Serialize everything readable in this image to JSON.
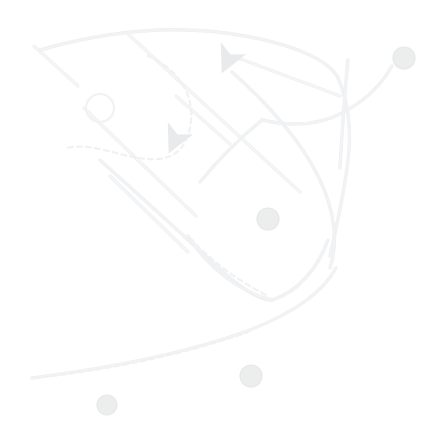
{
  "map": {
    "title": "Street Map View",
    "width": 448,
    "height": 437,
    "background_color": "#ffffff",
    "render_style": "very-low-contrast-faded",
    "zoom_level": "",
    "attribution": "",
    "colors": {
      "background": "#ffffff",
      "road_major": "#f2f3f4",
      "road_minor": "#f5f6f7",
      "road_casing": "#eeeff1",
      "rail_dashed": "#f0f1f2",
      "marker_fill": "#eceded",
      "marker_stroke": "#e7e8e9",
      "arrow_fill": "#e9eaeb",
      "circle_stroke": "#f1f2f3"
    },
    "layers": [
      {
        "id": "roads-curved",
        "name": "Curved Roads",
        "visible": true
      },
      {
        "id": "roads-diagonal",
        "name": "Diagonal Roads",
        "visible": true
      },
      {
        "id": "rail-dashed",
        "name": "Dashed Path",
        "visible": true
      },
      {
        "id": "markers",
        "name": "Place Markers",
        "visible": true
      },
      {
        "id": "direction-arrows",
        "name": "Direction Arrows",
        "visible": true
      }
    ],
    "roads_curved": [
      {
        "id": "road-north-loop",
        "d": "M 40 50 C 110 30 180 24 245 36 C 300 46 330 62 338 78"
      },
      {
        "id": "road-east-descend",
        "d": "M 338 78 C 348 100 352 130 348 160 C 344 196 336 228 330 256"
      },
      {
        "id": "road-center-diagonal",
        "d": "M 232 72 C 268 104 300 140 318 176 C 336 212 338 244 330 268"
      },
      {
        "id": "road-center-west",
        "d": "M 100 160 C 140 196 180 232 212 262 C 240 288 258 300 272 300"
      },
      {
        "id": "road-lower-arc",
        "d": "M 272 300 C 298 292 318 268 328 240"
      },
      {
        "id": "road-inner-arc",
        "d": "M 188 236 C 208 268 240 292 272 300"
      },
      {
        "id": "road-long-sweep",
        "d": "M 32 378 C 110 368 190 352 250 330 C 300 310 324 290 336 268"
      },
      {
        "id": "road-branch-upper",
        "d": "M 262 120 C 296 128 322 124 344 112"
      },
      {
        "id": "road-branch-right",
        "d": "M 344 112 C 366 100 382 84 392 66"
      },
      {
        "id": "road-vertical-right",
        "d": "M 348 60 C 344 96 342 136 340 168"
      },
      {
        "id": "road-spur-left",
        "d": "M 262 120 C 240 138 218 160 200 182"
      }
    ],
    "roads_diagonal": [
      {
        "id": "diag-nw-1",
        "d": "M 34 46 L 78 86"
      },
      {
        "id": "diag-nw-2",
        "d": "M 84 108 L 196 216"
      },
      {
        "id": "diag-main",
        "d": "M 128 34 L 300 192"
      },
      {
        "id": "diag-ne",
        "d": "M 238 58 L 340 96"
      },
      {
        "id": "diag-cross-1",
        "d": "M 176 96 L 230 144"
      },
      {
        "id": "diag-cross-2",
        "d": "M 110 176 L 188 252"
      }
    ],
    "dashed_paths": [
      {
        "id": "dash-arc-circle",
        "d": "M 148 56 C 186 72 200 108 186 140 C 172 170 136 158 104 150 C 88 146 76 146 66 148"
      },
      {
        "id": "dash-lower-sweep",
        "d": "M 34 378 C 110 370 186 354 248 332"
      },
      {
        "id": "dash-inner",
        "d": "M 190 238 C 212 262 240 282 268 296"
      }
    ],
    "circles": [
      {
        "id": "roundabout-1",
        "cx": 100,
        "cy": 108,
        "r": 14
      }
    ],
    "markers": [
      {
        "id": "marker-pin-top-right",
        "name": "marker-pin",
        "type": "pin",
        "x": 404,
        "y": 58,
        "r": 11
      },
      {
        "id": "marker-dot-center",
        "name": "marker-dot",
        "type": "dot",
        "x": 268,
        "y": 219,
        "r": 11
      },
      {
        "id": "marker-dot-lower",
        "name": "marker-dot",
        "type": "dot",
        "x": 251,
        "y": 376,
        "r": 11
      },
      {
        "id": "marker-dot-bottom-left",
        "name": "marker-dot",
        "type": "dot",
        "x": 107,
        "y": 405,
        "r": 10
      }
    ],
    "arrows": [
      {
        "id": "arrow-north",
        "name": "direction-arrow",
        "x": 228,
        "y": 60,
        "rotation": 205
      },
      {
        "id": "arrow-mid",
        "name": "direction-arrow",
        "x": 175,
        "y": 140,
        "rotation": 205
      }
    ]
  }
}
